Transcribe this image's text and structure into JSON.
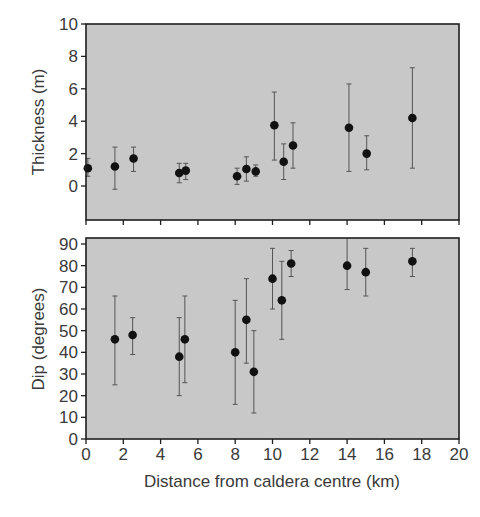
{
  "chart_data": [
    {
      "type": "scatter",
      "panel": "top",
      "title": "",
      "xlabel": "",
      "ylabel": "Thickness (m)",
      "xlim": [
        0,
        20
      ],
      "ylim": [
        -2.1,
        10
      ],
      "yticks": [
        0,
        2,
        4,
        6,
        8,
        10
      ],
      "xticks": [
        0,
        2,
        4,
        6,
        8,
        10,
        12,
        14,
        16,
        18,
        20
      ],
      "x_tick_labels_shown": false,
      "grid": false,
      "background": "#c8c8c8",
      "series": [
        {
          "name": "Thickness",
          "points": [
            {
              "x": 0.1,
              "y": 1.1,
              "err_low": 0.6,
              "err_high": 1.7
            },
            {
              "x": 1.55,
              "y": 1.2,
              "err_low": -0.2,
              "err_high": 2.4
            },
            {
              "x": 2.55,
              "y": 1.7,
              "err_low": 0.9,
              "err_high": 2.4
            },
            {
              "x": 5.0,
              "y": 0.8,
              "err_low": 0.2,
              "err_high": 1.4
            },
            {
              "x": 5.35,
              "y": 0.95,
              "err_low": 0.4,
              "err_high": 1.4
            },
            {
              "x": 8.1,
              "y": 0.6,
              "err_low": 0.1,
              "err_high": 1.1
            },
            {
              "x": 8.6,
              "y": 1.05,
              "err_low": 0.3,
              "err_high": 1.8
            },
            {
              "x": 9.1,
              "y": 0.9,
              "err_low": 0.6,
              "err_high": 1.3
            },
            {
              "x": 10.1,
              "y": 3.75,
              "err_low": 1.6,
              "err_high": 5.8
            },
            {
              "x": 10.6,
              "y": 1.5,
              "err_low": 0.4,
              "err_high": 2.6
            },
            {
              "x": 11.1,
              "y": 2.5,
              "err_low": 1.1,
              "err_high": 3.9
            },
            {
              "x": 14.1,
              "y": 3.6,
              "err_low": 0.9,
              "err_high": 6.3
            },
            {
              "x": 15.05,
              "y": 2.0,
              "err_low": 1.0,
              "err_high": 3.1
            },
            {
              "x": 17.5,
              "y": 4.2,
              "err_low": 1.1,
              "err_high": 7.3
            }
          ]
        }
      ]
    },
    {
      "type": "scatter",
      "panel": "bottom",
      "title": "",
      "xlabel": "Distance from caldera centre (km)",
      "ylabel": "Dip (degrees)",
      "xlim": [
        0,
        20
      ],
      "ylim": [
        0,
        93
      ],
      "yticks": [
        0,
        10,
        20,
        30,
        40,
        50,
        60,
        70,
        80,
        90
      ],
      "xticks": [
        0,
        2,
        4,
        6,
        8,
        10,
        12,
        14,
        16,
        18,
        20
      ],
      "grid": false,
      "background": "#c8c8c8",
      "series": [
        {
          "name": "Dip",
          "points": [
            {
              "x": 1.55,
              "y": 46,
              "err_low": 25,
              "err_high": 66
            },
            {
              "x": 2.5,
              "y": 48,
              "err_low": 39,
              "err_high": 56
            },
            {
              "x": 5.0,
              "y": 38,
              "err_low": 20,
              "err_high": 56
            },
            {
              "x": 5.3,
              "y": 46,
              "err_low": 26,
              "err_high": 66
            },
            {
              "x": 8.0,
              "y": 40,
              "err_low": 16,
              "err_high": 64
            },
            {
              "x": 8.6,
              "y": 55,
              "err_low": 35,
              "err_high": 74
            },
            {
              "x": 9.0,
              "y": 31,
              "err_low": 12,
              "err_high": 50
            },
            {
              "x": 10.0,
              "y": 74,
              "err_low": 60,
              "err_high": 88
            },
            {
              "x": 10.5,
              "y": 64,
              "err_low": 46,
              "err_high": 82
            },
            {
              "x": 11.0,
              "y": 81,
              "err_low": 75,
              "err_high": 87
            },
            {
              "x": 14.0,
              "y": 80,
              "err_low": 69,
              "err_high": 95
            },
            {
              "x": 15.0,
              "y": 77,
              "err_low": 66,
              "err_high": 88
            },
            {
              "x": 17.5,
              "y": 82,
              "err_low": 75,
              "err_high": 88
            }
          ]
        }
      ]
    }
  ],
  "labels": {
    "top_ylabel": "Thickness (m)",
    "bottom_ylabel": "Dip (degrees)",
    "xlabel": "Distance from caldera centre (km)",
    "top_yticks": [
      "0",
      "2",
      "4",
      "6",
      "8",
      "10"
    ],
    "bottom_yticks": [
      "0",
      "10",
      "20",
      "30",
      "40",
      "50",
      "60",
      "70",
      "80",
      "90"
    ],
    "xticks": [
      "0",
      "2",
      "4",
      "6",
      "8",
      "10",
      "12",
      "14",
      "16",
      "18",
      "20"
    ]
  },
  "colors": {
    "plot_background": "#c8c8c8",
    "frame": "#1e1e1e",
    "marker": "#111111",
    "error_bar": "#555555",
    "text": "#3a3a3a"
  }
}
